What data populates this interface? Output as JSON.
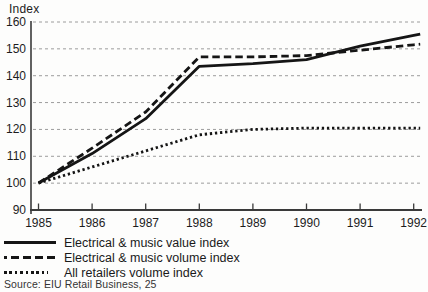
{
  "source": "Source: EIU Retail Business, 25",
  "chart_data": {
    "type": "line",
    "title": "",
    "xlabel": "",
    "ylabel": "Index",
    "x": [
      "1985",
      "1986",
      "1987",
      "1988",
      "1989",
      "1990",
      "1991",
      "1992"
    ],
    "ylim": [
      90,
      160
    ],
    "yticks": [
      90,
      100,
      110,
      120,
      130,
      140,
      150,
      160
    ],
    "grid": true,
    "legend_position": "bottom-left",
    "series": [
      {
        "name": "Electrical & music value index",
        "style": "solid",
        "values": [
          100,
          111,
          124,
          143.5,
          144.5,
          146,
          151,
          155
        ]
      },
      {
        "name": "Electrical & music volume index",
        "style": "dashed",
        "values": [
          100,
          113,
          126.5,
          147,
          147,
          147.5,
          149.5,
          151.5
        ]
      },
      {
        "name": "All retailers volume index",
        "style": "dotted",
        "values": [
          100,
          106,
          112,
          118,
          120,
          120.5,
          120.5,
          120.5
        ]
      }
    ],
    "colors": {
      "line": "#151515",
      "grid": "#9c9c9c",
      "axis": "#3a3a3a",
      "text": "#1c1c1c"
    }
  }
}
